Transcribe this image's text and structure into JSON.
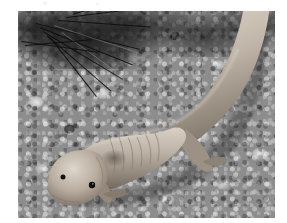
{
  "page": {
    "background_color": "#ffffff",
    "caption": "",
    "width": 287,
    "height": 223
  },
  "photograph": {
    "name": "salamander-on-gravel-photo",
    "alt_text": "Black and white photograph of a pale larval salamander resting on aquarium gravel beneath a conifer sprig",
    "subject": "salamander",
    "color_mode": "black-and-white",
    "frame": {
      "x": 18,
      "y": 11,
      "width": 257,
      "height": 207
    },
    "border_color": "#6f6f6f",
    "tones": {
      "animal_light": "#cfc6bb",
      "animal_mid": "#a79b90",
      "animal_shadow": "#6e655c",
      "gravel_base": "#8d8d8d",
      "gravel_light": "#e2e2e2",
      "gravel_dark": "#3c3c3c",
      "foliage_dark": "#141414",
      "eye": "#101010"
    },
    "elements": [
      {
        "name": "salamander-head",
        "label": "head"
      },
      {
        "name": "salamander-left-eye",
        "label": "left eye"
      },
      {
        "name": "salamander-right-eye",
        "label": "right eye"
      },
      {
        "name": "salamander-body",
        "label": "body with costal grooves"
      },
      {
        "name": "salamander-tail",
        "label": "tail curving to upper right"
      },
      {
        "name": "salamander-forelimb",
        "label": "front limb"
      },
      {
        "name": "salamander-hindlimb",
        "label": "hind limb"
      },
      {
        "name": "gravel-substrate",
        "label": "gravel substrate"
      },
      {
        "name": "conifer-sprig",
        "label": "conifer sprig"
      }
    ]
  }
}
